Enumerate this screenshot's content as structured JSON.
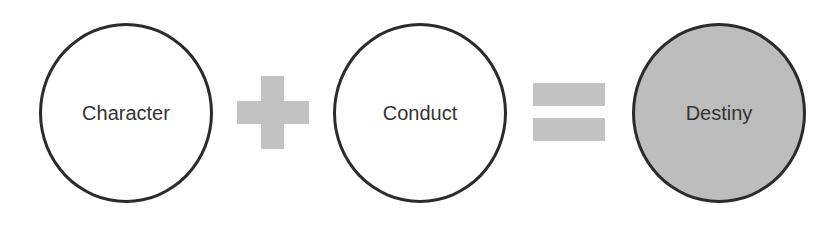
{
  "diagram": {
    "terms": [
      {
        "label": "Character",
        "fill": "#ffffff"
      },
      {
        "label": "Conduct",
        "fill": "#ffffff"
      },
      {
        "label": "Destiny",
        "fill": "#bdbdbd"
      }
    ],
    "operators": [
      "plus",
      "equals"
    ],
    "colors": {
      "stroke": "#2b2b2b",
      "operator": "#c2c2c2",
      "result_fill": "#bdbdbd"
    }
  }
}
